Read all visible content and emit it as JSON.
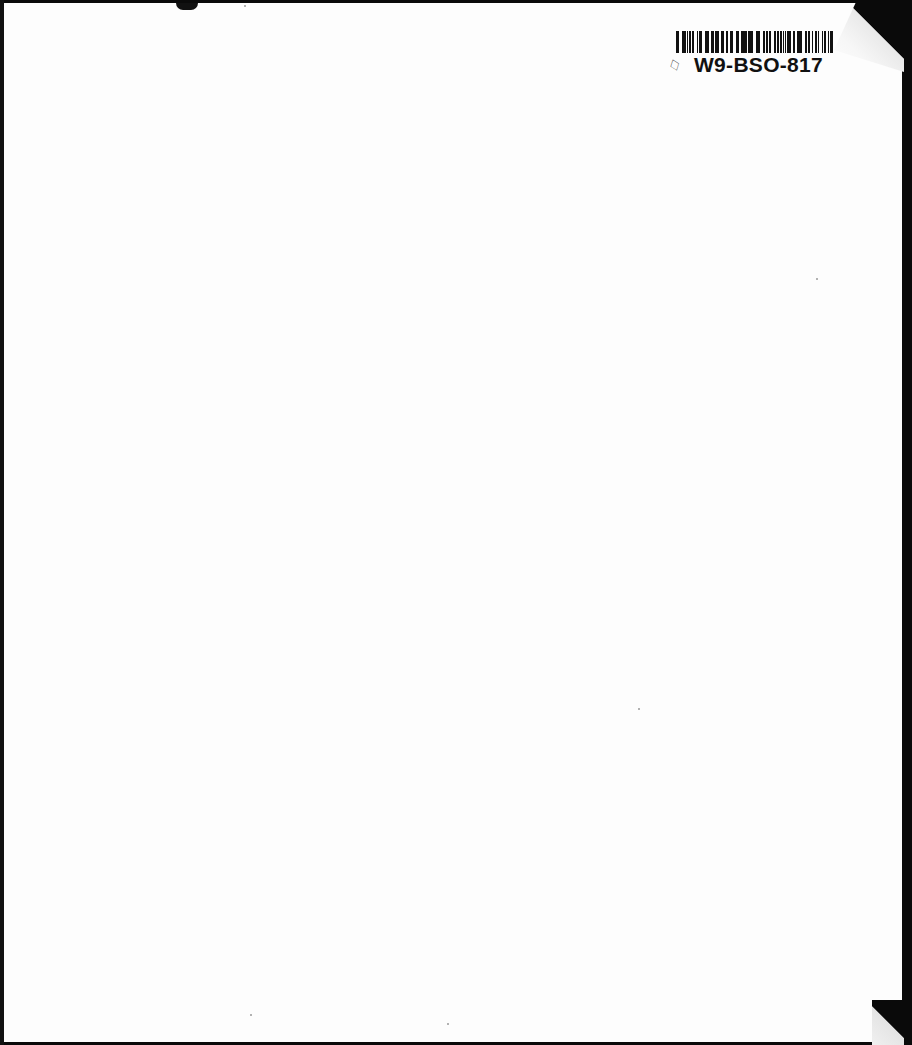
{
  "document": {
    "type": "scanned blank book cover",
    "label": {
      "barcode_id": "W9-BSO-817",
      "icon": "book-outline-icon",
      "icon_glyph": "♢"
    }
  }
}
